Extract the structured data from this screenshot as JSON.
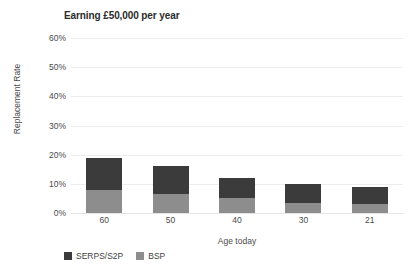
{
  "chart_data": {
    "type": "bar",
    "subtype": "stacked-bar",
    "title": "Earning £50,000 per year",
    "xlabel": "Age today",
    "ylabel": "Replacement Rate",
    "categories": [
      "60",
      "50",
      "40",
      "30",
      "21"
    ],
    "ylim": [
      0,
      60
    ],
    "ytick_labels": [
      "0%",
      "10%",
      "20%",
      "30%",
      "40%",
      "50%",
      "60%"
    ],
    "ytick_values": [
      0,
      10,
      20,
      30,
      40,
      50,
      60
    ],
    "grid": "horizontal",
    "legend_position": "bottom-left",
    "series": [
      {
        "name": "BSP",
        "color": "#8d8d8d",
        "values": [
          8,
          6.5,
          5,
          3.5,
          3
        ]
      },
      {
        "name": "SERPS/S2P",
        "color": "#3b3b3b",
        "values": [
          11,
          9.5,
          7,
          6.5,
          6
        ]
      }
    ],
    "stack_order": [
      "BSP",
      "SERPS/S2P"
    ],
    "totals": [
      19,
      16,
      12,
      10,
      9
    ]
  },
  "legend": {
    "items": [
      {
        "label": "SERPS/S2P",
        "color": "#3b3b3b"
      },
      {
        "label": "BSP",
        "color": "#8d8d8d"
      }
    ]
  },
  "colors": {
    "serps": "#3b3b3b",
    "bsp": "#8d8d8d",
    "grid": "#ededed",
    "text": "#4a4a4a",
    "background": "#ffffff"
  }
}
